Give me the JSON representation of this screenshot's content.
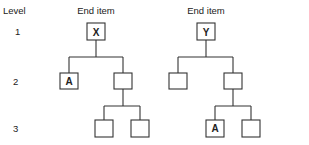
{
  "header": {
    "level_label": "Level",
    "tree_left_title": "End item",
    "tree_right_title": "End item"
  },
  "levels": [
    "1",
    "2",
    "3"
  ],
  "trees": [
    {
      "title": "End item",
      "root": "X",
      "level2": [
        "A",
        ""
      ],
      "level3": [
        "",
        ""
      ]
    },
    {
      "title": "End item",
      "root": "Y",
      "level2": [
        "",
        ""
      ],
      "level3": [
        "A",
        ""
      ]
    }
  ]
}
